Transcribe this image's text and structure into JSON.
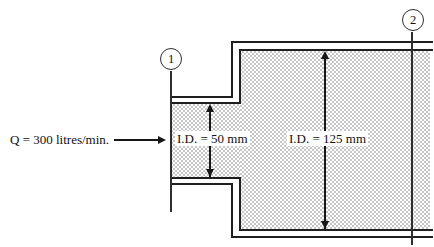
{
  "colors": {
    "line": "#1f1f1f",
    "section-line": "#2e2e2e",
    "arrow": "#161616",
    "hatch-dot": "#c6c6c6",
    "paper": "#ffffff",
    "text": "#121212"
  },
  "diagram": {
    "flow_label": "Q = 300 litres/min.",
    "labels": {
      "small_pipe_id": "I.D. = 50 mm",
      "large_pipe_id": "I.D. = 125 mm"
    },
    "section_markers": [
      {
        "label": "1"
      },
      {
        "label": "2"
      }
    ]
  }
}
